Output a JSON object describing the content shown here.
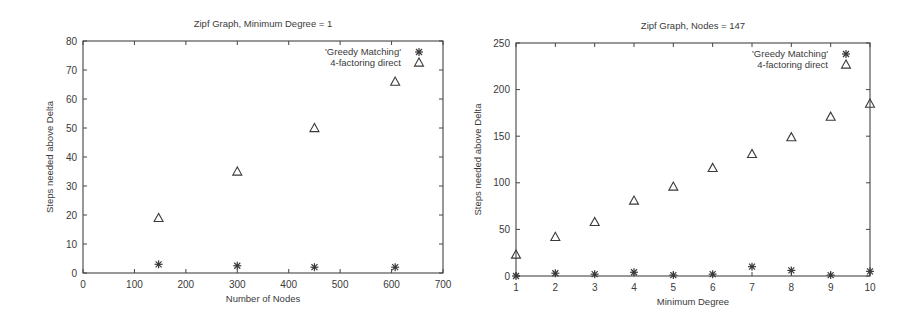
{
  "chart_data": [
    {
      "type": "scatter",
      "title": "Zipf Graph, Minimum Degree = 1",
      "xlabel": "Number of Nodes",
      "ylabel": "Steps needed above Delta",
      "xlim": [
        0,
        700
      ],
      "ylim": [
        0,
        80
      ],
      "xticks": [
        0,
        100,
        200,
        300,
        400,
        500,
        600,
        700
      ],
      "yticks": [
        0,
        10,
        20,
        30,
        40,
        50,
        60,
        70,
        80
      ],
      "grid": false,
      "legend_position": "top-right",
      "series": [
        {
          "name": "'Greedy Matching'",
          "marker": "asterisk",
          "x": [
            147,
            300,
            450,
            607
          ],
          "y": [
            3,
            2.5,
            2,
            2
          ]
        },
        {
          "name": "4-factoring direct",
          "marker": "triangle",
          "x": [
            147,
            300,
            450,
            607
          ],
          "y": [
            19,
            35,
            50,
            66
          ]
        }
      ]
    },
    {
      "type": "scatter",
      "title": "Zipf Graph, Nodes = 147",
      "xlabel": "Minimum Degree",
      "ylabel": "Steps needed above Delta",
      "xlim": [
        1,
        10
      ],
      "ylim": [
        0,
        250
      ],
      "xticks": [
        1,
        2,
        3,
        4,
        5,
        6,
        7,
        8,
        9,
        10
      ],
      "yticks": [
        0,
        50,
        100,
        150,
        200,
        250
      ],
      "grid": false,
      "legend_position": "top-right",
      "series": [
        {
          "name": "'Greedy Matching'",
          "marker": "asterisk",
          "x": [
            1,
            2,
            3,
            4,
            5,
            6,
            7,
            8,
            9,
            10
          ],
          "y": [
            0,
            3,
            2,
            4,
            1,
            2,
            10,
            6,
            1,
            5
          ]
        },
        {
          "name": "4-factoring direct",
          "marker": "triangle",
          "x": [
            1,
            2,
            3,
            4,
            5,
            6,
            7,
            8,
            9,
            10
          ],
          "y": [
            23,
            42,
            58,
            81,
            96,
            116,
            131,
            149,
            171,
            185
          ]
        }
      ]
    }
  ],
  "layout": [
    {
      "box": {
        "x0": 83,
        "y0": 41,
        "x1": 443,
        "y1": 273
      }
    },
    {
      "box": {
        "x0": 516,
        "y0": 43,
        "x1": 870,
        "y1": 276
      }
    }
  ],
  "colors": {
    "axis": "#444444",
    "marker": "#3a3a3a",
    "text": "#3a3a3a"
  }
}
